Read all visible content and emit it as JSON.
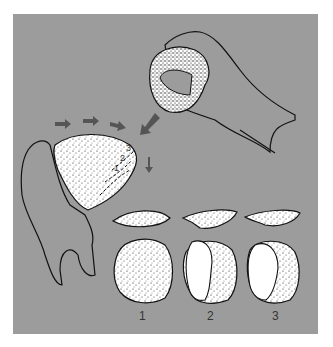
{
  "figure": {
    "colors": {
      "background": "#9c9c9c",
      "arrow": "#555555",
      "outline": "#111111",
      "stone": "#ffffff"
    },
    "core_flake_labels": [
      "1",
      "2",
      "3"
    ],
    "sequence_labels": [
      "1",
      "2",
      "3"
    ]
  }
}
